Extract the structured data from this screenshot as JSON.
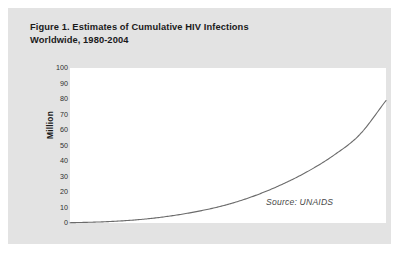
{
  "figure": {
    "title_line1": "Figure 1. Estimates of Cumulative HIV Infections",
    "title_line2": "Worldwide, 1980-2004",
    "source_note": "Source: UNAIDS",
    "panel_color": "#e3e3e3",
    "plot_background": "#ffffff",
    "line_color": "#6b6b6b"
  },
  "chart_data": {
    "type": "line",
    "title": "Figure 1. Estimates of Cumulative HIV Infections Worldwide, 1980-2004",
    "xlabel": "",
    "ylabel": "Million",
    "ylim": [
      0,
      100
    ],
    "xlim": [
      1980,
      2004
    ],
    "grid": false,
    "legend": "none",
    "annotations": [
      "Source: UNAIDS"
    ],
    "ytick_labels": [
      "100",
      "90",
      "80",
      "70",
      "60",
      "50",
      "40",
      "30",
      "20",
      "10",
      "0"
    ],
    "ytick_values": [
      100,
      90,
      80,
      70,
      60,
      50,
      40,
      30,
      20,
      10,
      0
    ],
    "xtick_labels": [],
    "series": [
      {
        "name": "Cumulative HIV infections",
        "x": [
          1980,
          1982,
          1984,
          1986,
          1988,
          1990,
          1992,
          1994,
          1996,
          1998,
          2000,
          2002,
          2004
        ],
        "values": [
          0.2,
          0.6,
          1.4,
          2.8,
          5.0,
          8.0,
          12.0,
          17.5,
          24.5,
          33.0,
          43.5,
          57.0,
          79.0
        ]
      }
    ]
  }
}
